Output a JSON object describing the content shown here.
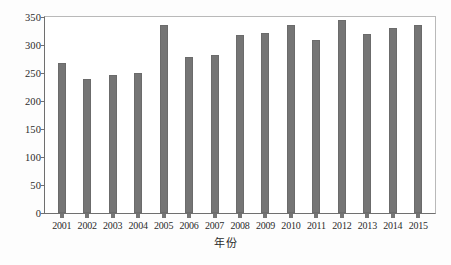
{
  "chart_data": {
    "type": "bar",
    "title": "",
    "subtitle": "",
    "xlabel": "年份",
    "ylabel": "",
    "categories": [
      "2001",
      "2002",
      "2003",
      "2004",
      "2005",
      "2006",
      "2007",
      "2008",
      "2009",
      "2010",
      "2011",
      "2012",
      "2013",
      "2014",
      "2015"
    ],
    "values": [
      267,
      239,
      246,
      250,
      335,
      278,
      283,
      317,
      322,
      335,
      309,
      344,
      319,
      330,
      335
    ],
    "series": [
      {
        "name": "",
        "values": [
          267,
          239,
          246,
          250,
          335,
          278,
          283,
          317,
          322,
          335,
          309,
          344,
          319,
          330,
          335
        ]
      }
    ],
    "ylim": [
      0,
      350
    ],
    "yticks": [
      0,
      50,
      100,
      150,
      200,
      250,
      300,
      350
    ],
    "ytick_labels": [
      "0",
      "50",
      "100",
      "150",
      "200",
      "250",
      "300",
      "350"
    ],
    "grid": false,
    "legend": false,
    "legend_position": "none",
    "bar_color": "#757575",
    "axis_color": "#6f6f6f",
    "frame_color": "#b9b9b9",
    "background_color": "#ffffff"
  }
}
